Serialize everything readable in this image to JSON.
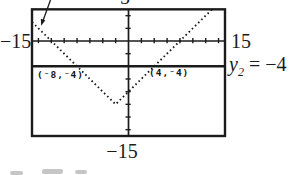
{
  "figure": {
    "bg_color": "#ffffff",
    "ink_color": "#1b1b1b"
  },
  "labels": {
    "x_min": "−15",
    "x_max": "15",
    "y_min": "−15",
    "y_max_partial": "5",
    "y2_var": "y",
    "y2_sub": "2",
    "y2_eq": " = −4"
  },
  "point_labels": {
    "left": "(⁻8,⁻4)",
    "right": "(4,⁻4)"
  },
  "chart_data": {
    "type": "line",
    "title": "",
    "window": {
      "xmin": -15,
      "xmax": 15,
      "ymin": -15,
      "ymax": 5,
      "xscl": 2,
      "yscl": 2
    },
    "grid": false,
    "series": [
      {
        "name": "y1",
        "equation": "y1 = |x + 2| - 10",
        "style": "dotted",
        "x": [
          -15,
          -2,
          13
        ],
        "y": [
          3,
          -10,
          5
        ],
        "vertex": [
          -2,
          -10
        ]
      },
      {
        "name": "y2",
        "equation": "y2 = -4",
        "style": "solid",
        "x": [
          -15,
          15
        ],
        "y": [
          -4,
          -4
        ]
      }
    ],
    "labeled_points": [
      {
        "x": -8,
        "y": -4,
        "label": "(⁻8,⁻4)"
      },
      {
        "x": 4,
        "y": -4,
        "label": "(4,⁻4)"
      }
    ],
    "axis_labels": {
      "x_axis_ends": [
        "−15",
        "15"
      ],
      "y_axis_ends": [
        "−15",
        "5 (cut off at top)"
      ]
    },
    "annotations": [
      {
        "type": "arrow",
        "target": "descending left branch of y1 near top-left corner"
      }
    ]
  }
}
